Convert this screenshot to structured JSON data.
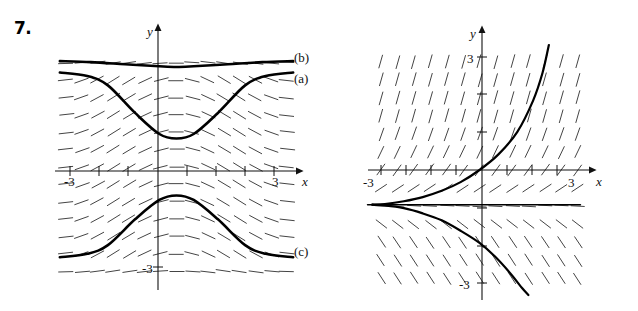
{
  "page": {
    "background": "#ffffff",
    "ink": "#111111",
    "width": 638,
    "height": 311
  },
  "figures": [
    {
      "id": "fig7",
      "number": "7.",
      "axis": {
        "x_label": "x",
        "y_label": "y",
        "x_ticks": [
          "-3",
          "3"
        ],
        "y_ticks": [
          "-3"
        ]
      },
      "curve_labels": [
        "(b)",
        "(a)",
        "(c)"
      ]
    },
    {
      "id": "fig9",
      "number": "9.",
      "axis": {
        "x_label": "x",
        "y_label": "y",
        "x_ticks": [
          "-3",
          "3"
        ],
        "y_ticks": [
          "3",
          "-3"
        ]
      },
      "curve_labels": []
    }
  ],
  "chart_data": [
    {
      "type": "line",
      "title": "7.",
      "subtitle": "Direction field with three solution curves",
      "xlabel": "x",
      "ylabel": "y",
      "xlim": [
        -3.6,
        3.6
      ],
      "ylim": [
        -3.6,
        3.6
      ],
      "grid": false,
      "legend": "inline-right",
      "xticks": [
        -3,
        -2,
        -1,
        0,
        1,
        2,
        3
      ],
      "xticklabels": [
        "-3",
        "",
        "",
        "",
        "",
        "",
        "3"
      ],
      "yticks": [
        -3,
        3
      ],
      "yticklabels": [
        "-3",
        ""
      ],
      "field": {
        "kind": "direction-field",
        "slope_expression": "dy/dx = shallow, sign follows -sin-like wave; near-horizontal dashes",
        "rows": 13,
        "cols": 15
      },
      "series": [
        {
          "name": "(b)",
          "label": "(b)",
          "description": "nearly flat upper solution curve, slight dip near x=0",
          "x": [
            -3.4,
            -2.5,
            -1.5,
            -0.5,
            0,
            0.5,
            1.5,
            2.5,
            3.4
          ],
          "y": [
            3.05,
            3.02,
            2.96,
            2.9,
            2.88,
            2.9,
            2.96,
            3.02,
            3.05
          ]
        },
        {
          "name": "(a)",
          "label": "(a)",
          "description": "upper solution curve with a deep trough centred at x=0",
          "x": [
            -3.4,
            -2.6,
            -2.0,
            -1.2,
            -0.5,
            0,
            0.5,
            1.2,
            2.0,
            2.6,
            3.4
          ],
          "y": [
            2.72,
            2.62,
            2.35,
            1.55,
            0.95,
            0.82,
            0.95,
            1.55,
            2.35,
            2.62,
            2.72
          ]
        },
        {
          "name": "(c)",
          "label": "(c)",
          "description": "lower solution curve, a hump peaking at x=0",
          "x": [
            -3.4,
            -2.6,
            -2.0,
            -1.2,
            -0.5,
            0,
            0.5,
            1.2,
            2.0,
            2.6,
            3.4
          ],
          "y": [
            -2.6,
            -2.5,
            -2.25,
            -1.5,
            -0.95,
            -0.82,
            -0.95,
            -1.5,
            -2.25,
            -2.5,
            -2.6
          ]
        }
      ]
    },
    {
      "type": "line",
      "title": "9.",
      "subtitle": "Direction field with solution curves through the origin",
      "xlabel": "x",
      "ylabel": "y",
      "xlim": [
        -3.6,
        3.6
      ],
      "ylim": [
        -3.6,
        3.6
      ],
      "grid": false,
      "legend": "none",
      "xticks": [
        -3,
        -2,
        -1,
        0,
        1,
        2,
        3
      ],
      "xticklabels": [
        "-3",
        "",
        "",
        "",
        "",
        "",
        "3"
      ],
      "yticks": [
        -3,
        -2,
        -1,
        1,
        2,
        3
      ],
      "yticklabels": [
        "-3",
        "",
        "",
        "",
        "",
        "3"
      ],
      "field": {
        "kind": "direction-field",
        "slope_expression": "steep positive slopes above the x-axis, shallow negative slopes below",
        "rows": 12,
        "cols": 12
      },
      "series": [
        {
          "name": "upper-branch",
          "label": "",
          "description": "curve rising steeply through the origin toward +y at x≈2.2",
          "x": [
            -3.4,
            -3.0,
            -2.4,
            -1.8,
            -1.2,
            -0.6,
            0,
            0.6,
            1.2,
            1.7,
            2.0,
            2.2
          ],
          "y": [
            -1.0,
            -0.98,
            -0.9,
            -0.78,
            -0.6,
            -0.35,
            0,
            0.45,
            1.1,
            2.0,
            2.8,
            3.6
          ]
        },
        {
          "name": "lower-branch",
          "label": "",
          "description": "curve falling from the horizontal asymptote down past y=-3 at x≈1.5",
          "x": [
            -3.4,
            -3.0,
            -2.4,
            -1.8,
            -1.2,
            -0.6,
            0,
            0.5,
            1.0,
            1.35,
            1.55
          ],
          "y": [
            -1.0,
            -1.02,
            -1.1,
            -1.25,
            -1.45,
            -1.75,
            -2.1,
            -2.5,
            -3.0,
            -3.4,
            -3.6
          ]
        },
        {
          "name": "horizontal-asymptote",
          "label": "",
          "description": "straight horizontal equilibrium solution at y = -1",
          "x": [
            -3.4,
            3.4
          ],
          "y": [
            -1.0,
            -1.0
          ]
        }
      ]
    }
  ]
}
